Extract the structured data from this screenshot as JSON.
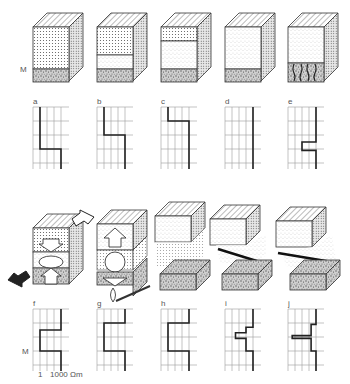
{
  "figure": {
    "marker_label": "M",
    "scale": {
      "min_label": "1",
      "max_label": "1000 Ωm"
    },
    "colors": {
      "line": "#222222",
      "grid": "#9a9a9a",
      "hatch": "#555555",
      "background": "#ffffff"
    }
  },
  "top_row": {
    "panels": [
      {
        "id": "a",
        "label": "a",
        "layers": [
          "fine-dotted",
          "coarse-speckled"
        ],
        "curve": [
          [
            1,
            0
          ],
          [
            1,
            3
          ],
          [
            4,
            3
          ],
          [
            4,
            4
          ]
        ]
      },
      {
        "id": "b",
        "label": "b",
        "layers": [
          "fine-dotted",
          "light-stipple",
          "coarse-speckled"
        ],
        "curve": [
          [
            1,
            0
          ],
          [
            1,
            2
          ],
          [
            4,
            2
          ],
          [
            4,
            4
          ]
        ]
      },
      {
        "id": "c",
        "label": "c",
        "layers": [
          "fine-dotted",
          "light-stipple",
          "coarse-speckled"
        ],
        "curve": [
          [
            1,
            0
          ],
          [
            1,
            1
          ],
          [
            4,
            1
          ],
          [
            4,
            4
          ]
        ]
      },
      {
        "id": "d",
        "label": "d",
        "layers": [
          "light-stipple",
          "coarse-speckled"
        ],
        "curve": [
          [
            4,
            0
          ],
          [
            4,
            4
          ]
        ]
      },
      {
        "id": "e",
        "label": "e",
        "layers": [
          "light-stipple",
          "root-zone",
          "coarse-speckled"
        ],
        "curve": [
          [
            4,
            0
          ],
          [
            4,
            2.5
          ],
          [
            2,
            2.5
          ],
          [
            2,
            3.1
          ],
          [
            4,
            3.1
          ],
          [
            4,
            4
          ]
        ]
      }
    ]
  },
  "bottom_row": {
    "panels": [
      {
        "id": "f",
        "label": "f",
        "feature": "compression-arrows-cavity",
        "curve": [
          [
            4,
            0
          ],
          [
            4,
            1.5
          ],
          [
            1,
            1.5
          ],
          [
            1,
            3
          ],
          [
            4,
            3
          ],
          [
            4,
            4
          ]
        ]
      },
      {
        "id": "g",
        "label": "g",
        "feature": "uplift-arrows-void-flame",
        "curve": [
          [
            4,
            0
          ],
          [
            4,
            1
          ],
          [
            1,
            1
          ],
          [
            1,
            3
          ],
          [
            4,
            3
          ],
          [
            4,
            4
          ]
        ]
      },
      {
        "id": "h",
        "label": "h",
        "feature": "separated-layers",
        "curve": [
          [
            4,
            0
          ],
          [
            4,
            1
          ],
          [
            1,
            1
          ],
          [
            1,
            3
          ],
          [
            4,
            3
          ],
          [
            4,
            4
          ]
        ]
      },
      {
        "id": "i",
        "label": "i",
        "feature": "tilted-fracture",
        "curve": [
          [
            4,
            0
          ],
          [
            4,
            1.3
          ],
          [
            3,
            1.3
          ],
          [
            3,
            1.7
          ],
          [
            1.5,
            1.7
          ],
          [
            1.5,
            2.1
          ],
          [
            3,
            2.1
          ],
          [
            3,
            3
          ],
          [
            4,
            3
          ],
          [
            4,
            4
          ]
        ]
      },
      {
        "id": "j",
        "label": "j",
        "feature": "thin-dark-seam",
        "curve": [
          [
            4,
            0
          ],
          [
            4,
            1.1
          ],
          [
            3.3,
            1.1
          ],
          [
            3.3,
            1.9
          ],
          [
            0.6,
            1.9
          ],
          [
            0.6,
            2.1
          ],
          [
            3.3,
            2.1
          ],
          [
            3.3,
            3
          ],
          [
            4,
            3
          ],
          [
            4,
            4
          ]
        ]
      }
    ]
  }
}
